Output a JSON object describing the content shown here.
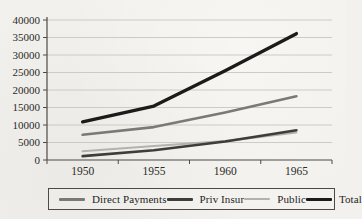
{
  "chart_data": {
    "type": "line",
    "title": "",
    "xlabel": "",
    "ylabel": "",
    "categories": [
      "1950",
      "1955",
      "1960",
      "1965"
    ],
    "y_ticks": [
      0,
      5000,
      10000,
      15000,
      20000,
      25000,
      30000,
      35000,
      40000
    ],
    "ylim": [
      0,
      40000
    ],
    "grid": "horizontal",
    "legend_position": "bottom-boxed",
    "series": [
      {
        "name": "Direct Payments",
        "color": "#7b7977",
        "line_width": 2.6,
        "values": [
          7200,
          9400,
          13600,
          18200
        ]
      },
      {
        "name": "Priv Insur",
        "color": "#3f3d3b",
        "line_width": 2.6,
        "values": [
          1100,
          2800,
          5300,
          8500
        ]
      },
      {
        "name": "Public",
        "color": "#b5b2ae",
        "line_width": 2.2,
        "values": [
          2500,
          4000,
          5400,
          7900
        ]
      },
      {
        "name": "Total",
        "color": "#1c1b1a",
        "line_width": 3.4,
        "values": [
          10900,
          15400,
          25500,
          36100
        ]
      }
    ]
  },
  "colors": {
    "background": "#f2f1ed",
    "gridline": "#c9c6c1",
    "axis": "#4c4a47",
    "text": "#2b2a28"
  }
}
